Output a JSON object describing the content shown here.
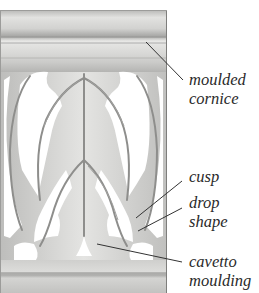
{
  "figure": {
    "colors": {
      "stone_light": "#e6e6e4",
      "stone_mid": "#c4c4c2",
      "stone_dark": "#8e8e8c",
      "background": "#ffffff",
      "label_text": "#2a2a2a",
      "leader_line": "#333333"
    }
  },
  "labels": [
    {
      "id": "moulded-cornice",
      "line1": "moulded",
      "line2": "cornice"
    },
    {
      "id": "cusp",
      "line1": "cusp"
    },
    {
      "id": "drop-shape",
      "line1": "drop",
      "line2": "shape"
    },
    {
      "id": "cavetto-moulding",
      "line1": "cavetto",
      "line2": "moulding"
    }
  ]
}
